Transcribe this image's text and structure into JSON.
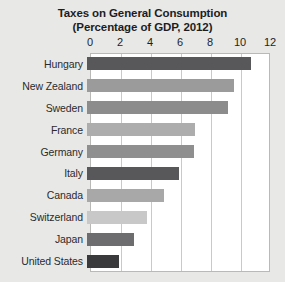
{
  "chart_data": {
    "type": "bar",
    "orientation": "horizontal",
    "title": "Taxes on General Consumption",
    "subtitle": "(Percentage of GDP, 2012)",
    "xlabel": "",
    "ylabel": "",
    "xlim": [
      0,
      12
    ],
    "xticks": [
      0,
      2,
      4,
      6,
      8,
      10,
      12
    ],
    "grid": true,
    "legend": "none",
    "categories": [
      "Hungary",
      "New Zealand",
      "Sweden",
      "France",
      "Germany",
      "Italy",
      "Canada",
      "Switzerland",
      "Japan",
      "United States"
    ],
    "values": [
      10.9,
      9.8,
      9.4,
      7.2,
      7.1,
      6.1,
      5.1,
      4.0,
      3.1,
      2.1
    ],
    "bar_colors": [
      "#58585a",
      "#9b9b9b",
      "#8c8c8c",
      "#adadad",
      "#8f8f8f",
      "#58585a",
      "#a8a8a8",
      "#c8c8c8",
      "#6d6d6f",
      "#3a3a3c"
    ]
  },
  "style": {
    "background": "#e8e8e6",
    "plot_background": "#ffffff",
    "gridline_color": "#c9c9c7",
    "border_color": "#b9b9b7",
    "text_color": "#1d1d1f"
  }
}
